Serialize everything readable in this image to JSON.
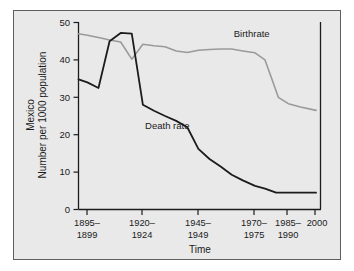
{
  "figure": {
    "background_color": "#e9e9e9",
    "frame_color": "#5e5e5e",
    "page_color": "#ffffff"
  },
  "chart_data": {
    "type": "line",
    "title": "",
    "xlabel": "Time",
    "ylabel_line1": "Mexico",
    "ylabel_line2": "Number per 1000 population",
    "ylim": [
      0,
      50
    ],
    "yticks": [
      0,
      10,
      20,
      30,
      40,
      50
    ],
    "ytick_labels": [
      "0",
      "10",
      "20",
      "30",
      "40",
      "50"
    ],
    "grid": false,
    "legend_position": "inline-annotations",
    "xtick_labels": [
      "1895–\n1899",
      "1920–\n1924",
      "1945–\n1949",
      "1970–\n1975",
      "1985–\n1990",
      "2000"
    ],
    "xtick_labels_flat": [
      "1895–1899",
      "1920–1924",
      "1945–1949",
      "1970–1975",
      "1985–1990",
      "2000"
    ],
    "xtick_line1": [
      "1895–",
      "1920–",
      "1945–",
      "1970–",
      "1985–",
      "2000"
    ],
    "xtick_line2": [
      "1899",
      "1924",
      "1949",
      "1975",
      "1990",
      ""
    ],
    "xtick_positions": [
      1897,
      1922,
      1947,
      1972.5,
      1987.5,
      2000
    ],
    "xlim": [
      1893,
      2002
    ],
    "series": [
      {
        "name": "Birthrate",
        "color": "#9a9a9a",
        "label_text": "Birthrate",
        "x": [
          1893,
          1897,
          1902,
          1907,
          1912,
          1917,
          1922,
          1927,
          1932,
          1937,
          1942,
          1947,
          1952,
          1957,
          1962,
          1967,
          1972.5,
          1977,
          1980,
          1983,
          1987.5,
          1993,
          2000
        ],
        "values": [
          47.0,
          46.6,
          46.0,
          45.3,
          44.8,
          40.2,
          44.2,
          43.8,
          43.5,
          42.4,
          42.0,
          42.6,
          42.8,
          42.9,
          42.9,
          42.4,
          41.9,
          40.0,
          35.0,
          30.0,
          28.3,
          27.4,
          26.5
        ]
      },
      {
        "name": "Death rate",
        "color": "#1c1c1c",
        "label_text": "Death rate",
        "x": [
          1893,
          1897,
          1902,
          1907,
          1912,
          1917,
          1922,
          1927,
          1932,
          1937,
          1942,
          1947,
          1952,
          1957,
          1962,
          1967,
          1972.5,
          1977,
          1982,
          1987.5,
          1993,
          2000
        ],
        "values": [
          34.8,
          34.0,
          32.5,
          45.0,
          47.2,
          47.0,
          28.0,
          26.4,
          25.0,
          23.7,
          22.0,
          16.2,
          13.5,
          11.5,
          9.3,
          7.8,
          6.3,
          5.6,
          4.5,
          4.5,
          4.5,
          4.5
        ]
      }
    ],
    "annotations": [
      {
        "text": "Birthrate",
        "x": 1971,
        "y": 46.2
      },
      {
        "text": "Death rate",
        "x": 1933,
        "y": 21.5
      }
    ]
  }
}
